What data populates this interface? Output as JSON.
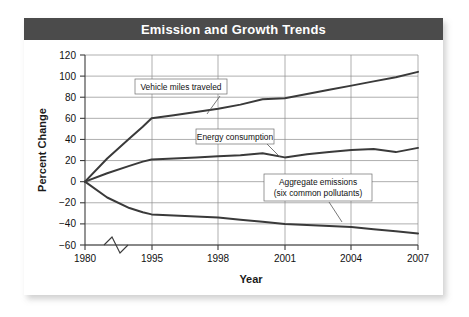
{
  "figure": {
    "title": "Emission and Growth Trends",
    "title_bar_color": "#4b4b4b",
    "title_text_color": "#ffffff",
    "card_background": "#ffffff"
  },
  "chart_data": {
    "type": "line",
    "title": "Emission and Growth Trends",
    "xlabel": "Year",
    "ylabel": "Percent Change",
    "grid": true,
    "legend_position": "inline-annotations",
    "axis_break": {
      "axis": "x",
      "between": [
        1980,
        1995
      ],
      "note": "zigzag break mark on x-axis"
    },
    "x_ticks": [
      "1980",
      "1995",
      "1998",
      "2001",
      "2004",
      "2007"
    ],
    "x_tick_values": [
      1980,
      1995,
      1998,
      2001,
      2004,
      2007
    ],
    "y_ticks": [
      "120",
      "100",
      "80",
      "60",
      "40",
      "20",
      "0",
      "-20",
      "-40",
      "-60"
    ],
    "y_tick_values": [
      120,
      100,
      80,
      60,
      40,
      20,
      0,
      -20,
      -40,
      -60
    ],
    "ylim": [
      -60,
      120
    ],
    "series": [
      {
        "name": "Vehicle miles traveled",
        "color": "#3a3a3a",
        "x": [
          1980,
          1985,
          1990,
          1993,
          1995,
          1996,
          1997,
          1998,
          1999,
          2000,
          2001,
          2002,
          2003,
          2004,
          2005,
          2006,
          2007
        ],
        "values": [
          0,
          22,
          41,
          52,
          60,
          63,
          66,
          69,
          73,
          78,
          79,
          83,
          87,
          91,
          95,
          99,
          104
        ]
      },
      {
        "name": "Energy consumption",
        "color": "#3a3a3a",
        "x": [
          1980,
          1985,
          1990,
          1993,
          1995,
          1996,
          1997,
          1998,
          1999,
          2000,
          2001,
          2002,
          2003,
          2004,
          2005,
          2006,
          2007
        ],
        "values": [
          0,
          8,
          15,
          19,
          21,
          22,
          23,
          24,
          25,
          27,
          23,
          26,
          28,
          30,
          31,
          28,
          32
        ]
      },
      {
        "name": "Aggregate emissions (six common pollutants)",
        "color": "#3a3a3a",
        "x": [
          1980,
          1985,
          1990,
          1993,
          1995,
          1996,
          1997,
          1998,
          1999,
          2000,
          2001,
          2002,
          2003,
          2004,
          2005,
          2006,
          2007
        ],
        "values": [
          0,
          -15,
          -25,
          -29,
          -31,
          -32,
          -33,
          -34,
          -36,
          -38,
          -40,
          -41,
          -42,
          -43,
          -45,
          -47,
          -49
        ]
      }
    ],
    "annotations": [
      {
        "name": "vehicle-miles-traveled-label",
        "lines": [
          "Vehicle miles traveled"
        ]
      },
      {
        "name": "energy-consumption-label",
        "lines": [
          "Energy consumption"
        ]
      },
      {
        "name": "aggregate-emissions-label",
        "lines": [
          "Aggregate emissions",
          "(six common pollutants)"
        ]
      }
    ]
  },
  "axes": {
    "y_label": "Percent Change",
    "x_label": "Year",
    "y_tick_0": "120",
    "y_tick_1": "100",
    "y_tick_2": "80",
    "y_tick_3": "60",
    "y_tick_4": "40",
    "y_tick_5": "20",
    "y_tick_6": "0",
    "y_tick_7": "−20",
    "y_tick_8": "−40",
    "y_tick_9": "−60",
    "x_tick_0": "1980",
    "x_tick_1": "1995",
    "x_tick_2": "1998",
    "x_tick_3": "2001",
    "x_tick_4": "2004",
    "x_tick_5": "2007"
  },
  "annotations": {
    "vehicle_miles": "Vehicle miles traveled",
    "energy_consumption": "Energy consumption",
    "aggregate_line1": "Aggregate emissions",
    "aggregate_line2": "(six common pollutants)"
  }
}
